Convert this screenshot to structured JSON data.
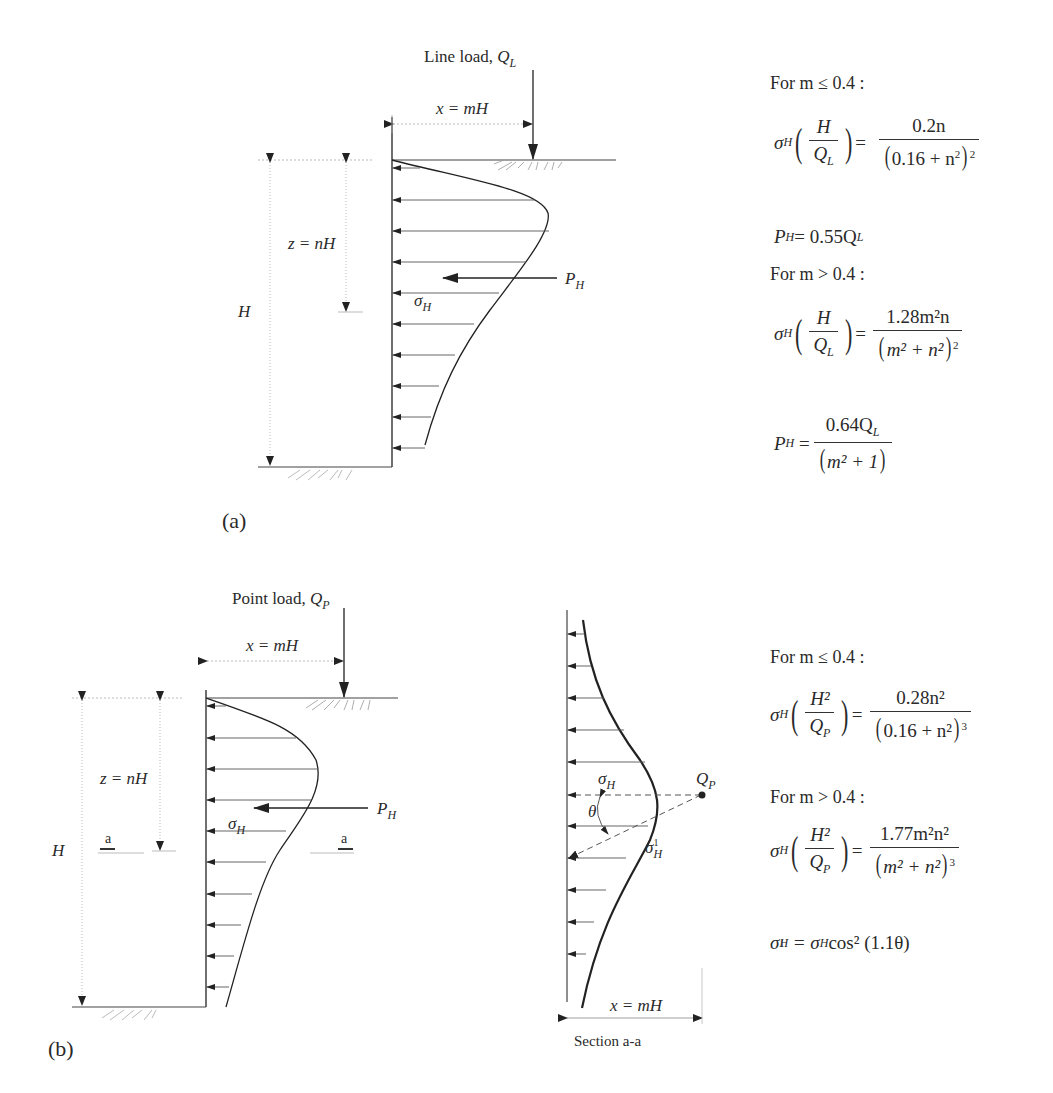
{
  "figure": {
    "panel_a": {
      "tag": "(a)",
      "load_label": "Line load, ",
      "load_symbol": "Q",
      "load_sub": "L",
      "x_dim": "x = mH",
      "z_dim": "z = nH",
      "H_label": "H",
      "resultant_label": "P",
      "resultant_sub": "H",
      "stress_label": "σ",
      "stress_sub": "H",
      "equations": {
        "cond1": "For  m ≤ 0.4 :",
        "eq1_lhs": "σ",
        "eq1_lhs_sub": "H",
        "eq1_frac_num": "H",
        "eq1_frac_den": "Q",
        "eq1_frac_den_sub": "L",
        "eq1_rhs_num": "0.2n",
        "eq1_rhs_den_inner": "0.16 + n",
        "eq1_rhs_den_inner_sup": "2",
        "eq1_rhs_den_pow": "2",
        "eq2": "P",
        "eq2_sub": "H",
        "eq2_rhs": " = 0.55Q",
        "eq2_rhs_sub": "L",
        "cond2": "For  m > 0.4 :",
        "eq3_rhs_num": "1.28m²n",
        "eq3_rhs_den_inner": "m² + n²",
        "eq3_rhs_den_pow": "2",
        "eq4_num": "0.64Q",
        "eq4_num_sub": "L",
        "eq4_den": "m² + 1"
      }
    },
    "panel_b": {
      "tag": "(b)",
      "load_label": "Point load, ",
      "load_symbol": "Q",
      "load_sub": "P",
      "x_dim": "x = mH",
      "z_dim": "z = nH",
      "H_label": "H",
      "resultant_label": "P",
      "resultant_sub": "H",
      "stress_label": "σ",
      "stress_sub": "H",
      "section_marker": "a",
      "section": {
        "title": "Section a-a",
        "x_dim": "x = mH",
        "point_label": "Q",
        "point_sub": "P",
        "stress_label": "σ",
        "stress_sub": "H",
        "stress1_label": "σ",
        "stress1_sup": "1",
        "stress1_sub": "H",
        "angle_label": "θ"
      },
      "equations": {
        "cond1": "For  m ≤ 0.4 :",
        "eq1_frac_num": "H²",
        "eq1_frac_den": "Q",
        "eq1_frac_den_sub": "P",
        "eq1_rhs_num": "0.28n²",
        "eq1_rhs_den_inner": "0.16 + n²",
        "eq1_rhs_den_pow": "3",
        "cond2": "For  m > 0.4 :",
        "eq2_rhs_num": "1.77m²n²",
        "eq2_rhs_den_inner": "m² + n²",
        "eq2_rhs_den_pow": "3",
        "eq3": "= σ",
        "eq3_sub": "H",
        "eq3_rest": " cos² (1.1θ)"
      }
    }
  }
}
